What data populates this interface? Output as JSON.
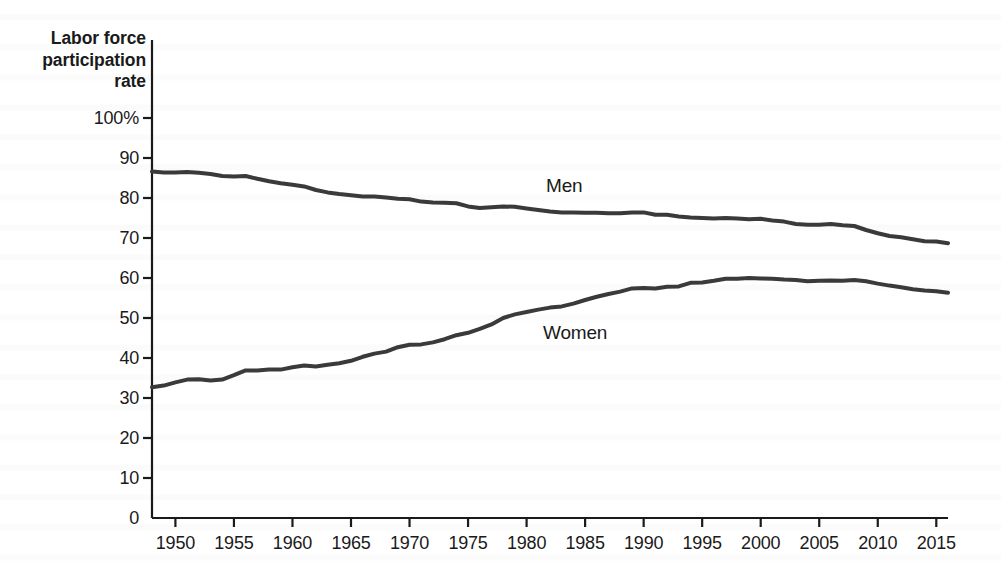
{
  "figure": {
    "background_color": "#ffffff",
    "axis_color": "#1a1a1a",
    "text_color": "#1a1a1a"
  },
  "axis_title": {
    "line1": "Labor force",
    "line2": "participation",
    "line3": "rate"
  },
  "yticks": [
    "100%",
    "90",
    "80",
    "70",
    "60",
    "50",
    "40",
    "30",
    "20",
    "10",
    "0"
  ],
  "xticks": [
    "1950",
    "1955",
    "1960",
    "1965",
    "1970",
    "1975",
    "1980",
    "1985",
    "1990",
    "1995",
    "2000",
    "2005",
    "2010",
    "2015"
  ],
  "series_labels": {
    "men": "Men",
    "women": "Women"
  },
  "chart_data": {
    "type": "line",
    "title": "",
    "subtitle": "",
    "xlabel": "",
    "ylabel": "Labor force participation rate",
    "xlim": [
      1948,
      2016
    ],
    "ylim": [
      0,
      100
    ],
    "grid": false,
    "legend_position": "inline-annotation",
    "yticks": [
      0,
      10,
      20,
      30,
      40,
      50,
      60,
      70,
      80,
      90,
      100
    ],
    "xticks": [
      1950,
      1955,
      1960,
      1965,
      1970,
      1975,
      1980,
      1985,
      1990,
      1995,
      2000,
      2005,
      2010,
      2015
    ],
    "ytick_labels": [
      "0",
      "10",
      "20",
      "30",
      "40",
      "50",
      "60",
      "70",
      "80",
      "90",
      "100%"
    ],
    "y_unit": "percent",
    "x": [
      1948,
      1949,
      1950,
      1951,
      1952,
      1953,
      1954,
      1955,
      1956,
      1957,
      1958,
      1959,
      1960,
      1961,
      1962,
      1963,
      1964,
      1965,
      1966,
      1967,
      1968,
      1969,
      1970,
      1971,
      1972,
      1973,
      1974,
      1975,
      1976,
      1977,
      1978,
      1979,
      1980,
      1981,
      1982,
      1983,
      1984,
      1985,
      1986,
      1987,
      1988,
      1989,
      1990,
      1991,
      1992,
      1993,
      1994,
      1995,
      1996,
      1997,
      1998,
      1999,
      2000,
      2001,
      2002,
      2003,
      2004,
      2005,
      2006,
      2007,
      2008,
      2009,
      2010,
      2011,
      2012,
      2013,
      2014,
      2015,
      2016
    ],
    "series": [
      {
        "name": "Men",
        "color": "#3a3a3a",
        "line_width": 4,
        "values": [
          86.6,
          86.4,
          86.4,
          86.5,
          86.3,
          86.0,
          85.5,
          85.4,
          85.5,
          84.8,
          84.2,
          83.7,
          83.3,
          82.9,
          82.0,
          81.4,
          81.0,
          80.7,
          80.4,
          80.4,
          80.1,
          79.8,
          79.7,
          79.1,
          78.9,
          78.8,
          78.7,
          77.9,
          77.5,
          77.7,
          77.9,
          77.8,
          77.4,
          77.0,
          76.6,
          76.4,
          76.4,
          76.3,
          76.3,
          76.2,
          76.2,
          76.4,
          76.4,
          75.8,
          75.8,
          75.4,
          75.1,
          75.0,
          74.9,
          75.0,
          74.9,
          74.7,
          74.8,
          74.4,
          74.1,
          73.5,
          73.3,
          73.3,
          73.5,
          73.2,
          73.0,
          72.0,
          71.2,
          70.5,
          70.2,
          69.7,
          69.2,
          69.1,
          68.7
        ]
      },
      {
        "name": "Women",
        "color": "#3a3a3a",
        "line_width": 4,
        "values": [
          32.7,
          33.1,
          33.9,
          34.6,
          34.7,
          34.4,
          34.6,
          35.7,
          36.9,
          36.9,
          37.1,
          37.1,
          37.7,
          38.1,
          37.9,
          38.3,
          38.7,
          39.3,
          40.3,
          41.1,
          41.6,
          42.7,
          43.3,
          43.4,
          43.9,
          44.7,
          45.7,
          46.3,
          47.3,
          48.4,
          50.0,
          50.9,
          51.5,
          52.1,
          52.6,
          52.9,
          53.6,
          54.5,
          55.3,
          56.0,
          56.6,
          57.4,
          57.5,
          57.4,
          57.8,
          57.9,
          58.8,
          58.9,
          59.3,
          59.8,
          59.8,
          60.0,
          59.9,
          59.8,
          59.6,
          59.5,
          59.2,
          59.3,
          59.4,
          59.3,
          59.5,
          59.2,
          58.6,
          58.1,
          57.7,
          57.2,
          56.9,
          56.7,
          56.3
        ]
      }
    ],
    "annotations": [
      {
        "text": "Men",
        "x": 1982,
        "y": 80
      },
      {
        "text": "Women",
        "x": 1982,
        "y": 48
      }
    ]
  },
  "geometry": {
    "plot_left": 152,
    "plot_right": 948,
    "plot_top": 118,
    "plot_bottom": 518
  }
}
